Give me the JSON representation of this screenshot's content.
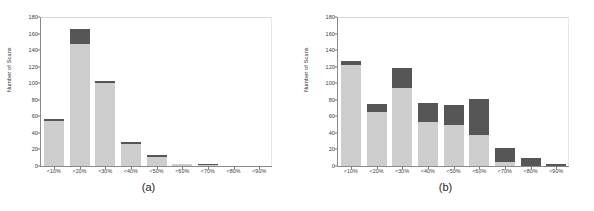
{
  "figure": {
    "background": "#ffffff",
    "light_color": "#cdcdcd",
    "dark_color": "#565656"
  },
  "chart_data": [
    {
      "type": "bar",
      "panel_label": "(a)",
      "title": "",
      "xlabel": "",
      "ylabel": "Number of Scans",
      "ylim": [
        0,
        180
      ],
      "yticks": [
        0,
        20,
        40,
        60,
        80,
        100,
        120,
        140,
        160,
        180
      ],
      "grid": false,
      "legend": "none",
      "stacked": true,
      "categories": [
        "<10%",
        "<20%",
        "<30%",
        "<40%",
        "<50%",
        "<60%",
        "<70%",
        "<80%",
        "<90%"
      ],
      "series": [
        {
          "name": "lower",
          "color": "#cdcdcd",
          "values": [
            54,
            148,
            100,
            27,
            11,
            2,
            1,
            0,
            0
          ]
        },
        {
          "name": "upper",
          "color": "#565656",
          "values": [
            3,
            17,
            3,
            2,
            2,
            1,
            1,
            0,
            0
          ]
        }
      ],
      "totals": [
        57,
        165,
        103,
        29,
        13,
        3,
        2,
        0,
        0
      ]
    },
    {
      "type": "bar",
      "panel_label": "(b)",
      "title": "",
      "xlabel": "",
      "ylabel": "Number of Scans",
      "ylim": [
        0,
        180
      ],
      "yticks": [
        0,
        20,
        40,
        60,
        80,
        100,
        120,
        140,
        160,
        180
      ],
      "grid": false,
      "legend": "none",
      "stacked": true,
      "categories": [
        "<10%",
        "<20%",
        "<30%",
        "<40%",
        "<50%",
        "<60%",
        "<70%",
        "<80%",
        "<90%"
      ],
      "series": [
        {
          "name": "lower",
          "color": "#cdcdcd",
          "values": [
            122,
            65,
            94,
            53,
            50,
            38,
            5,
            0,
            0
          ]
        },
        {
          "name": "upper",
          "color": "#565656",
          "values": [
            5,
            10,
            24,
            23,
            24,
            43,
            17,
            10,
            2
          ]
        }
      ],
      "totals": [
        127,
        75,
        118,
        76,
        74,
        81,
        22,
        10,
        2
      ]
    }
  ]
}
